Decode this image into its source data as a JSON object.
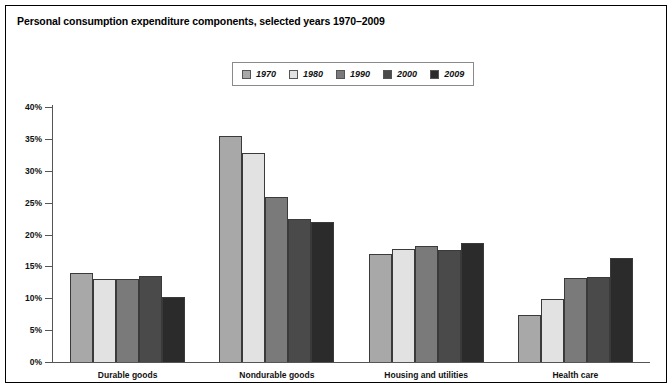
{
  "title": "Personal consumption expenditure components, selected years 1970–2009",
  "legend": {
    "position": "top-center",
    "items": [
      {
        "label": "1970",
        "color": "#a8a8a8"
      },
      {
        "label": "1980",
        "color": "#e2e2e2"
      },
      {
        "label": "1990",
        "color": "#7a7a7a"
      },
      {
        "label": "2000",
        "color": "#4a4a4a"
      },
      {
        "label": "2009",
        "color": "#2b2b2b"
      }
    ]
  },
  "axis": {
    "y_ticks": [
      "0%",
      "5%",
      "10%",
      "15%",
      "20%",
      "25%",
      "30%",
      "35%",
      "40%"
    ],
    "y_values": [
      0,
      5,
      10,
      15,
      20,
      25,
      30,
      35,
      40
    ]
  },
  "chart_data": {
    "type": "bar",
    "title": "Personal consumption expenditure components, selected years 1970–2009",
    "xlabel": "",
    "ylabel": "",
    "ylim": [
      0,
      40
    ],
    "ytick_format": "percent",
    "grid": false,
    "legend_position": "top-center",
    "categories": [
      "Durable goods",
      "Nondurable goods",
      "Housing and utilities",
      "Health care"
    ],
    "series": [
      {
        "name": "1970",
        "color": "#a8a8a8",
        "values": [
          13.9,
          35.4,
          17.0,
          7.4
        ]
      },
      {
        "name": "1980",
        "color": "#e2e2e2",
        "values": [
          13.0,
          32.8,
          17.8,
          9.9
        ]
      },
      {
        "name": "1990",
        "color": "#7a7a7a",
        "values": [
          13.0,
          25.9,
          18.2,
          13.2
        ]
      },
      {
        "name": "2000",
        "color": "#4a4a4a",
        "values": [
          13.5,
          22.5,
          17.6,
          13.4
        ]
      },
      {
        "name": "2009",
        "color": "#2b2b2b",
        "values": [
          10.2,
          22.0,
          18.7,
          16.3
        ]
      }
    ]
  }
}
